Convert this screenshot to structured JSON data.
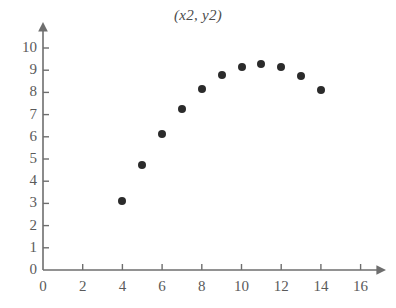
{
  "chart_data": {
    "type": "scatter",
    "title": "(x2, y2)",
    "xlabel": "",
    "ylabel": "",
    "x": [
      10,
      8,
      13,
      9,
      11,
      14,
      6,
      4,
      12,
      7,
      5
    ],
    "y": [
      9.14,
      8.14,
      8.74,
      8.77,
      9.26,
      8.1,
      6.13,
      3.1,
      9.13,
      7.26,
      4.74
    ],
    "points": [
      {
        "x": 4,
        "y": 3.1
      },
      {
        "x": 5,
        "y": 4.74
      },
      {
        "x": 6,
        "y": 6.13
      },
      {
        "x": 7,
        "y": 7.26
      },
      {
        "x": 8,
        "y": 8.14
      },
      {
        "x": 9,
        "y": 8.77
      },
      {
        "x": 10,
        "y": 9.14
      },
      {
        "x": 11,
        "y": 9.26
      },
      {
        "x": 12,
        "y": 9.13
      },
      {
        "x": 13,
        "y": 8.74
      },
      {
        "x": 14,
        "y": 8.1
      }
    ],
    "xlim": [
      0,
      16.8
    ],
    "ylim": [
      0,
      11.2
    ],
    "xticks": [
      0,
      2,
      4,
      6,
      8,
      10,
      12,
      14,
      16
    ],
    "xtick_labels": [
      "0",
      "2",
      "4",
      "6",
      "8",
      "10",
      "12",
      "14",
      "16"
    ],
    "yticks": [
      0,
      1,
      2,
      3,
      4,
      5,
      6,
      7,
      8,
      9,
      10
    ],
    "ytick_labels": [
      "0",
      "1",
      "2",
      "3",
      "4",
      "5",
      "6",
      "7",
      "8",
      "9",
      "10"
    ],
    "grid": false,
    "legend": null,
    "marker_color": "#2b2b2b",
    "axis_color": "#6e6e6e",
    "text_color": "#5a5a5a",
    "axis_arrows": true
  }
}
